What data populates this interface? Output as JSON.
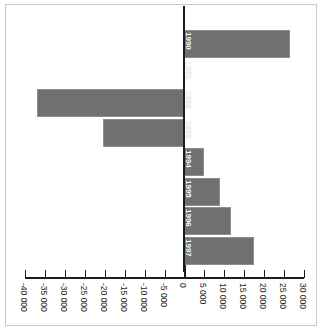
{
  "chart_data": {
    "type": "bar",
    "orientation": "horizontal",
    "title": "",
    "subtitle": "",
    "xlabel": "",
    "ylabel": "",
    "categories": [
      "1990",
      "1991",
      "1992",
      "1993",
      "1994",
      "1995",
      "1996",
      "1997"
    ],
    "values": [
      26400,
      0,
      -37000,
      -20400,
      4800,
      9000,
      11600,
      17400
    ],
    "series": [
      {
        "name": "",
        "values": [
          26400,
          0,
          -37000,
          -20400,
          4800,
          9000,
          11600,
          17400
        ]
      }
    ],
    "xlim": [
      -40000,
      30000
    ],
    "xticks": [
      -40000,
      -35000,
      -30000,
      -25000,
      -20000,
      -15000,
      -10000,
      -5000,
      0,
      5000,
      10000,
      15000,
      20000,
      25000,
      30000
    ],
    "xticklabels": [
      "-40 000",
      "-35 000",
      "-30 000",
      "-25 000",
      "-20 000",
      "-15 000",
      "-10 000",
      "-5 000",
      "0",
      "5 000",
      "10 000",
      "15 000",
      "20 000",
      "25 000",
      "30 000"
    ],
    "grid": false,
    "legend": null,
    "legend_position": "none",
    "bar_color": "#707070",
    "axis_color": "#1d1d1d",
    "frame_color": "#c9c9c9",
    "label_color": "#ffffff",
    "background": "#ffffff"
  }
}
